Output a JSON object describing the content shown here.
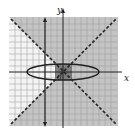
{
  "graph": {
    "x_axis_label": "x",
    "y_axis_label": "y",
    "origin_label": "0",
    "grid": {
      "xmin": -9,
      "xmax": 9,
      "ymin": -9,
      "ymax": 9,
      "step": 1
    },
    "curves": [
      {
        "name": "ellipse",
        "style": "solid",
        "equation_hint": "x^2/36 + y^2/1.8 = 1"
      },
      {
        "name": "asymptote-1",
        "style": "dashed",
        "slope": 1
      },
      {
        "name": "asymptote-2",
        "style": "dashed",
        "slope": -1
      },
      {
        "name": "vertical-line",
        "style": "solid-arrowed",
        "x": -3
      }
    ],
    "colors": {
      "shade_light": "#b8b8b8",
      "shade_dark": "#7a7a7a",
      "grid": "#8a8a8a",
      "axis": "#222222",
      "background": "#ffffff"
    }
  }
}
